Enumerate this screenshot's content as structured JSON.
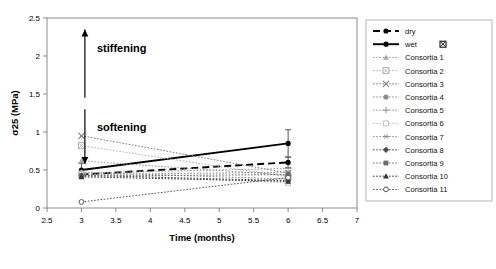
{
  "chart_data": {
    "type": "line",
    "title": "",
    "xlabel": "Time (months)",
    "ylabel": "σ25 (MPa)",
    "xlim": [
      2.5,
      7
    ],
    "ylim": [
      0,
      2.5
    ],
    "xticks": [
      "2.5",
      "3",
      "3.5",
      "4",
      "4.5",
      "5",
      "5.5",
      "6",
      "6.5",
      "7"
    ],
    "yticks": [
      "0",
      "0.5",
      "1",
      "1.5",
      "2",
      "2.5"
    ],
    "grid": false,
    "legend_position": "right-outside",
    "x": [
      3,
      6
    ],
    "annotations": [
      {
        "text": "stiffening",
        "direction": "up",
        "x": 3.05,
        "y_from": 1.45,
        "y_to": 2.35
      },
      {
        "text": "softening",
        "direction": "down",
        "x": 3.05,
        "y_from": 1.3,
        "y_to": 0.58
      }
    ],
    "series": [
      {
        "name": "dry",
        "values": [
          0.44,
          0.6
        ],
        "marker": "circle-filled",
        "style": "dashed-long",
        "color": "#000000",
        "error": [
          0.0,
          0.07
        ]
      },
      {
        "name": "wet",
        "values": [
          0.5,
          0.85
        ],
        "marker": "circle-filled",
        "style": "solid",
        "color": "#000000",
        "error": [
          0.09,
          0.18
        ]
      },
      {
        "name": "Consortia 1",
        "values": [
          0.62,
          0.43
        ],
        "marker": "triangle",
        "style": "dotted",
        "color": "#9a9a9a"
      },
      {
        "name": "Consortia 2",
        "values": [
          0.82,
          0.41
        ],
        "marker": "boxed-x",
        "style": "dotted",
        "color": "#b0b0b0"
      },
      {
        "name": "Consortia 3",
        "values": [
          0.95,
          0.46
        ],
        "marker": "x",
        "style": "dotted",
        "color": "#7a7a7a"
      },
      {
        "name": "Consortia 4",
        "values": [
          0.47,
          0.38
        ],
        "marker": "circle-filled",
        "style": "dotted",
        "color": "#8c8c8c"
      },
      {
        "name": "Consortia 5",
        "values": [
          0.46,
          0.52
        ],
        "marker": "plus",
        "style": "dotted",
        "color": "#9a9a9a"
      },
      {
        "name": "Consortia 6",
        "values": [
          0.45,
          0.33
        ],
        "marker": "square-open",
        "style": "dotted",
        "color": "#c0c0c0"
      },
      {
        "name": "Consortia 7",
        "values": [
          0.44,
          0.47
        ],
        "marker": "asterisk",
        "style": "dotted",
        "color": "#8c8c8c"
      },
      {
        "name": "Consortia 8",
        "values": [
          0.43,
          0.36
        ],
        "marker": "diamond-filled",
        "style": "dotted",
        "color": "#4a4a4a"
      },
      {
        "name": "Consortia 9",
        "values": [
          0.42,
          0.44
        ],
        "marker": "square-filled",
        "style": "dotted",
        "color": "#6a6a6a"
      },
      {
        "name": "Consortia 10",
        "values": [
          0.41,
          0.35
        ],
        "marker": "triangle-filled",
        "style": "dotted",
        "color": "#333333"
      },
      {
        "name": "Consortia 11",
        "values": [
          0.08,
          0.4
        ],
        "marker": "circle-open",
        "style": "dotted",
        "color": "#555555"
      }
    ]
  }
}
